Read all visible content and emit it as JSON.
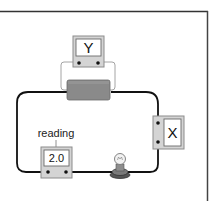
{
  "diagram": {
    "type": "circuit",
    "meters": {
      "top": {
        "label": "Y"
      },
      "right": {
        "label": "X"
      },
      "bottom_left": {
        "label": "2.0",
        "annotation": "reading"
      }
    },
    "components": [
      {
        "id": "resistor",
        "kind": "resistor-block"
      },
      {
        "id": "bulb",
        "kind": "light-bulb"
      },
      {
        "id": "meter-y",
        "kind": "meter",
        "connection": "parallel across resistor"
      },
      {
        "id": "meter-x",
        "kind": "meter",
        "connection": "series on right side"
      },
      {
        "id": "meter-reading",
        "kind": "meter",
        "connection": "series on bottom left"
      }
    ],
    "colors": {
      "wire": "#111111",
      "meter_body": "#d4d4d4",
      "meter_face": "#ffffff",
      "resistor": "#8a8a8a",
      "frame": "#333333"
    }
  }
}
